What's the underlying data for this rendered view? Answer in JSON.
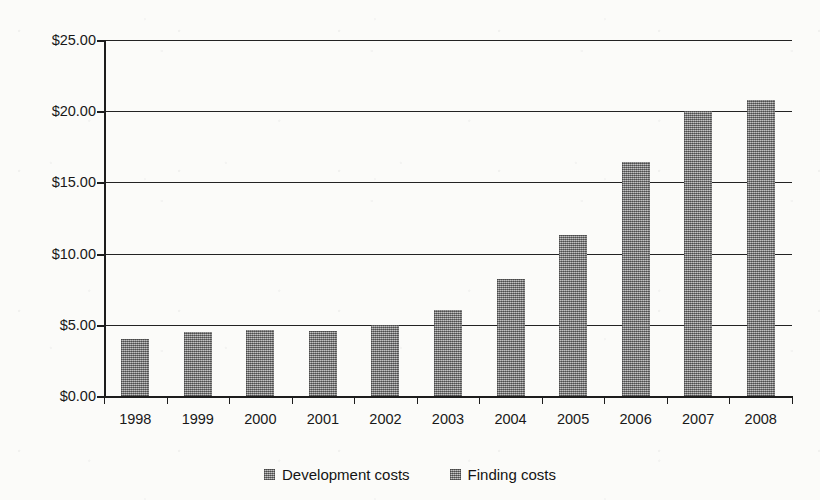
{
  "chart_data": {
    "type": "bar",
    "title": "",
    "xlabel": "",
    "ylabel": "",
    "categories": [
      "1998",
      "1999",
      "2000",
      "2001",
      "2002",
      "2003",
      "2004",
      "2005",
      "2006",
      "2007",
      "2008"
    ],
    "series": [
      {
        "name": "Development costs",
        "values": [
          4.0,
          4.5,
          4.65,
          4.6,
          5.0,
          6.05,
          8.25,
          11.3,
          16.4,
          20.05,
          20.8
        ]
      },
      {
        "name": "Finding costs",
        "values": [
          null,
          null,
          null,
          null,
          null,
          null,
          null,
          null,
          null,
          null,
          null
        ]
      }
    ],
    "values": [
      4.0,
      4.5,
      4.65,
      4.6,
      5.0,
      6.05,
      8.25,
      11.3,
      16.4,
      20.05,
      20.8
    ],
    "ylim": [
      0,
      25
    ],
    "ytick_values": [
      0,
      5,
      10,
      15,
      20,
      25
    ],
    "ytick_labels": [
      "$0.00",
      "$5.00",
      "$10.00",
      "$15.00",
      "$20.00",
      "$25.00"
    ],
    "grid": true,
    "legend_position": "bottom",
    "bar_color": "#8b8b8b",
    "axis_color": "#1d1d1d",
    "background_color": "#fbfbf9"
  },
  "legend": {
    "items": [
      {
        "label": "Development costs"
      },
      {
        "label": "Finding costs"
      }
    ]
  }
}
